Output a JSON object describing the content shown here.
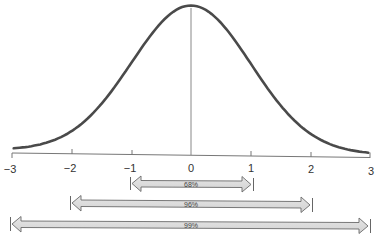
{
  "diagram": {
    "curve": {
      "color": "#4a4a4a",
      "mean": 0,
      "sd": 1
    },
    "axis": {
      "ticks": [
        {
          "value": -3,
          "label": "−3"
        },
        {
          "value": -2,
          "label": "−2"
        },
        {
          "value": -1,
          "label": "−1"
        },
        {
          "value": 0,
          "label": "0"
        },
        {
          "value": 1,
          "label": "1"
        },
        {
          "value": 2,
          "label": "2"
        },
        {
          "value": 3,
          "label": "3"
        }
      ]
    },
    "ranges": [
      {
        "label": "68%",
        "from": -1,
        "to": 1
      },
      {
        "label": "96%",
        "from": -2,
        "to": 2
      },
      {
        "label": "99%",
        "from": -3,
        "to": 3
      }
    ],
    "colors": {
      "arrow_fill": "#dcdcdc",
      "arrow_stroke": "#6a6a6a",
      "axis": "#777777"
    }
  }
}
